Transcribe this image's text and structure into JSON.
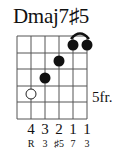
{
  "chord": {
    "name": "Dmaj7♯5",
    "start_fret_label": "5fr.",
    "strings": 6,
    "frets_shown": 5,
    "dots": [
      {
        "string": 2,
        "fret": 4,
        "type": "hollow"
      },
      {
        "string": 3,
        "fret": 3,
        "type": "filled"
      },
      {
        "string": 4,
        "fret": 2,
        "type": "filled"
      },
      {
        "string": 5,
        "fret": 1,
        "type": "filled"
      },
      {
        "string": 6,
        "fret": 1,
        "type": "filled"
      }
    ],
    "barre": {
      "from_string": 5,
      "to_string": 6,
      "fret": 1
    },
    "fingers": [
      "",
      "4",
      "3",
      "2",
      "1",
      "1"
    ],
    "degrees": [
      "",
      "R",
      "3",
      "♯5",
      "7",
      "3"
    ]
  }
}
